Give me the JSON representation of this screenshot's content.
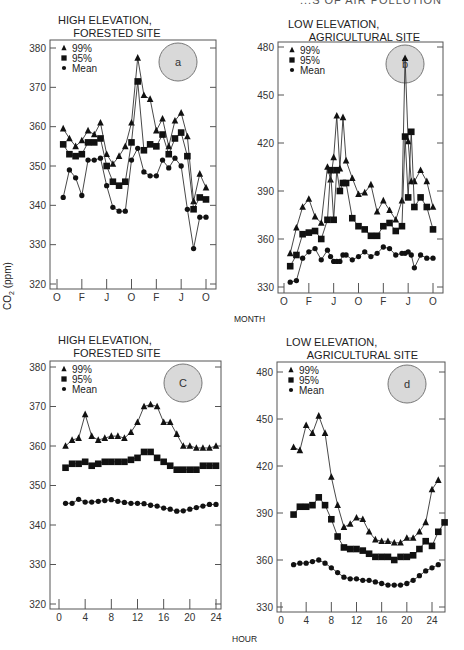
{
  "page": {
    "running_header": "...S OF AIR POLLUTION",
    "shared_ylabel": "CO2 (ppm)",
    "xlabel_top": "MONTH",
    "xlabel_bottom": "HOUR"
  },
  "legend": {
    "p99": "99%",
    "p95": "95%",
    "mean": "Mean"
  },
  "chart_data": [
    {
      "id": "a",
      "type": "line",
      "title": "HIGH ELEVATION,\n     FORESTED SITE",
      "badge": "a",
      "xlabel": "MONTH",
      "ylabel": "CO2 (ppm)",
      "ylim": [
        320,
        380
      ],
      "yticks": [
        320,
        330,
        340,
        350,
        360,
        370,
        380
      ],
      "xlim": [
        -0.5,
        25
      ],
      "xticks": [
        0,
        4,
        8,
        12,
        16,
        20,
        24
      ],
      "xtick_labels": [
        "O",
        "F",
        "J",
        "O",
        "F",
        "J",
        "O"
      ],
      "grid": false,
      "legend_position": "upper left",
      "x": [
        1,
        2,
        3,
        4,
        5,
        6,
        7,
        8,
        9,
        10,
        11,
        12,
        13,
        14,
        15,
        16,
        17,
        18,
        19,
        20,
        21,
        22,
        23,
        24
      ],
      "series": [
        {
          "name": "99%",
          "marker": "triangle",
          "values": [
            359.5,
            357,
            355,
            356.5,
            359,
            358,
            361,
            353,
            350.5,
            352.5,
            355,
            361,
            377.5,
            368,
            367,
            359,
            362,
            355,
            361.5,
            363.5,
            357.5,
            341,
            348,
            344.5
          ]
        },
        {
          "name": "95%",
          "marker": "square",
          "values": [
            355.5,
            353,
            352.5,
            353,
            356,
            356,
            357,
            350,
            346,
            345,
            346,
            356,
            371.5,
            354,
            355.5,
            355,
            358,
            353,
            357,
            358.5,
            352.5,
            339,
            342,
            341.5
          ]
        },
        {
          "name": "Mean",
          "marker": "circle",
          "values": [
            342,
            349,
            347,
            342.5,
            351.5,
            351.5,
            352,
            345,
            339.5,
            338.5,
            338.5,
            351.5,
            354.5,
            348.5,
            347.5,
            347.5,
            351.5,
            349.5,
            352,
            350,
            339,
            329,
            337,
            337
          ]
        }
      ]
    },
    {
      "id": "b",
      "type": "line",
      "title": "LOW ELEVATION,\n       AGRICULTURAL SITE",
      "badge": "b",
      "xlabel": "MONTH",
      "ylabel": "CO2 (ppm)",
      "ylim": [
        330,
        480
      ],
      "yticks": [
        330,
        360,
        390,
        420,
        450,
        480
      ],
      "xlim": [
        -0.5,
        25
      ],
      "xticks": [
        0,
        4,
        8,
        12,
        16,
        20,
        24
      ],
      "xtick_labels": [
        "O",
        "F",
        "J",
        "O",
        "F",
        "J",
        "O"
      ],
      "grid": false,
      "legend_position": "upper left",
      "x": [
        1,
        2,
        3,
        4,
        5,
        6,
        7,
        7.5,
        8,
        8.5,
        9,
        9.5,
        10,
        11,
        12,
        13,
        14,
        15,
        16,
        17,
        18,
        19,
        19.5,
        20,
        20.5,
        21,
        22,
        23,
        24
      ],
      "series": [
        {
          "name": "99%",
          "marker": "triangle",
          "values": [
            351,
            367,
            380,
            385,
            374,
            370,
            405,
            397,
            411,
            437,
            404,
            436,
            409,
            398,
            388,
            389,
            394,
            377,
            384,
            378,
            372,
            384,
            473,
            421,
            396,
            396,
            403,
            396,
            380
          ]
        },
        {
          "name": "95%",
          "marker": "square",
          "values": [
            343,
            350,
            363,
            364,
            365,
            360,
            372,
            403,
            372,
            403,
            390,
            395,
            395,
            373,
            368,
            366,
            362,
            362,
            368,
            370,
            365,
            368,
            424,
            386,
            427,
            380,
            386,
            380,
            366
          ]
        },
        {
          "name": "Mean",
          "marker": "circle",
          "values": [
            333,
            334,
            348,
            352,
            354,
            347,
            353,
            349,
            346,
            346,
            346,
            350,
            350,
            347,
            349,
            352,
            349,
            351,
            355,
            354,
            350,
            351,
            351,
            352,
            350,
            342,
            350,
            348,
            348
          ]
        }
      ]
    },
    {
      "id": "c",
      "type": "line",
      "title": "HIGH ELEVATION,\n     FORESTED SITE",
      "badge": "C",
      "xlabel": "HOUR",
      "ylabel": "CO2 (ppm)",
      "ylim": [
        320,
        380
      ],
      "yticks": [
        320,
        330,
        340,
        350,
        360,
        370,
        380
      ],
      "xlim": [
        -1,
        25
      ],
      "xticks": [
        0,
        4,
        8,
        12,
        16,
        20,
        24
      ],
      "grid": false,
      "legend_position": "upper left",
      "x": [
        1,
        2,
        3,
        4,
        5,
        6,
        7,
        8,
        9,
        10,
        11,
        12,
        13,
        14,
        15,
        16,
        17,
        18,
        19,
        20,
        21,
        22,
        23,
        24
      ],
      "series": [
        {
          "name": "99%",
          "marker": "triangle",
          "values": [
            360,
            361.5,
            362,
            368,
            362.5,
            361.5,
            362,
            362.5,
            362.5,
            362,
            363.5,
            366,
            370,
            370.5,
            370,
            366,
            366,
            363,
            360,
            360,
            359.5,
            359.5,
            359.5,
            360
          ]
        },
        {
          "name": "95%",
          "marker": "square",
          "values": [
            354.5,
            355.5,
            355.5,
            356,
            355,
            355.5,
            356,
            356,
            356,
            356,
            356.5,
            357,
            358.5,
            358.5,
            357,
            356,
            355,
            354,
            354,
            354,
            354,
            355,
            355,
            355
          ]
        },
        {
          "name": "Mean",
          "marker": "circle",
          "values": [
            345.5,
            345.5,
            346.5,
            345.8,
            345.8,
            346,
            346.2,
            346.4,
            346,
            345.7,
            345.5,
            345.5,
            345.4,
            345,
            344.8,
            344.3,
            344,
            343.5,
            343.6,
            344,
            344.4,
            344.8,
            345.2,
            345.2
          ]
        }
      ]
    },
    {
      "id": "d",
      "type": "line",
      "title": "LOW ELEVATION,\n       AGRICULTURAL SITE",
      "badge": "d",
      "xlabel": "HOUR",
      "ylabel": "CO2 (ppm)",
      "ylim": [
        330,
        480
      ],
      "yticks": [
        330,
        360,
        390,
        420,
        450,
        480
      ],
      "xlim": [
        -0.5,
        26.5
      ],
      "xticks": [
        0,
        4,
        8,
        12,
        16,
        20,
        24
      ],
      "grid": false,
      "legend_position": "upper left",
      "x": [
        2,
        3,
        4,
        5,
        6,
        7,
        8,
        9,
        10,
        11,
        12,
        13,
        14,
        15,
        16,
        17,
        18,
        19,
        20,
        21,
        22,
        23,
        24,
        25,
        26
      ],
      "series": [
        {
          "name": "99%",
          "marker": "triangle",
          "values": [
            432,
            430,
            446,
            441,
            452,
            441,
            413,
            395,
            381,
            383,
            387,
            386,
            378,
            373,
            372,
            372,
            371,
            371,
            374,
            374,
            378,
            384,
            405,
            411,
            null
          ]
        },
        {
          "name": "95%",
          "marker": "square",
          "values": [
            389,
            394,
            394,
            395,
            400,
            395,
            386,
            375,
            368,
            367,
            367,
            366,
            364,
            362,
            362,
            362,
            360,
            362,
            362,
            363,
            367,
            372,
            369,
            378,
            384
          ]
        },
        {
          "name": "Mean",
          "marker": "circle",
          "values": [
            357,
            358,
            358,
            359,
            360,
            358,
            355,
            352,
            349,
            348,
            348,
            347,
            347,
            346,
            345,
            344,
            344,
            344,
            345,
            347,
            350,
            353,
            355,
            357,
            null
          ]
        }
      ]
    }
  ]
}
